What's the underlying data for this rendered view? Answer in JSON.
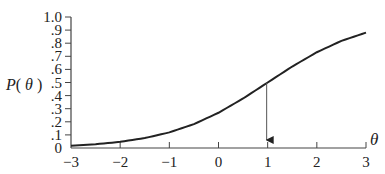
{
  "chart_data": {
    "type": "line",
    "title": "",
    "xlabel": "θ",
    "ylabel": "P(θ)",
    "xlim": [
      -3,
      3
    ],
    "ylim": [
      0,
      1.0
    ],
    "grid": false,
    "legend": null,
    "x_ticks": [
      -3,
      -2,
      -1,
      0,
      1,
      2,
      3
    ],
    "x_tick_labels": [
      "−3",
      "−2",
      "−1",
      "0",
      "1",
      "2",
      "3"
    ],
    "y_ticks": [
      0,
      0.1,
      0.2,
      0.3,
      0.4,
      0.5,
      0.6,
      0.7,
      0.8,
      0.9,
      1.0
    ],
    "y_tick_labels": [
      "0",
      ".1",
      ".2",
      ".3",
      ".4",
      ".5",
      ".6",
      ".7",
      ".8",
      ".9",
      "1.0"
    ],
    "series": [
      {
        "name": "Item characteristic curve",
        "x": [
          -3,
          -2.5,
          -2,
          -1.5,
          -1,
          -0.5,
          0,
          0.5,
          1,
          1.5,
          2,
          2.5,
          3
        ],
        "values": [
          0.018,
          0.029,
          0.047,
          0.076,
          0.119,
          0.182,
          0.269,
          0.378,
          0.5,
          0.622,
          0.731,
          0.818,
          0.881
        ]
      }
    ],
    "annotations": [
      {
        "type": "arrow",
        "from": [
          1,
          0.5
        ],
        "to": [
          1,
          0
        ],
        "description": "vertical arrow from curve at P=0.5 down to θ=1"
      }
    ]
  }
}
